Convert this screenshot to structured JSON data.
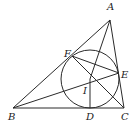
{
  "diagram": {
    "type": "geometry",
    "points": {
      "A": {
        "label": "A",
        "x": 110,
        "y": 20,
        "lx": 107,
        "ly": 10
      },
      "B": {
        "label": "B",
        "x": 13,
        "y": 108,
        "lx": 8,
        "ly": 120
      },
      "C": {
        "label": "C",
        "x": 124,
        "y": 108,
        "lx": 121,
        "ly": 120
      },
      "D": {
        "label": "D",
        "x": 90,
        "y": 108,
        "lx": 86,
        "ly": 120
      },
      "E": {
        "label": "E",
        "x": 119,
        "y": 73,
        "lx": 121,
        "ly": 78
      },
      "F": {
        "label": "F",
        "x": 72,
        "y": 56,
        "lx": 64,
        "ly": 57
      },
      "I": {
        "label": "I",
        "x": 90,
        "y": 79,
        "lx": 83,
        "ly": 94
      }
    },
    "circle": {
      "cx": 90,
      "cy": 79,
      "r": 29
    },
    "segments": [
      [
        "A",
        "B"
      ],
      [
        "B",
        "C"
      ],
      [
        "C",
        "A"
      ],
      [
        "A",
        "I"
      ],
      [
        "B",
        "E"
      ],
      [
        "F",
        "C"
      ],
      [
        "F",
        "E"
      ],
      [
        "I",
        "D"
      ]
    ]
  }
}
